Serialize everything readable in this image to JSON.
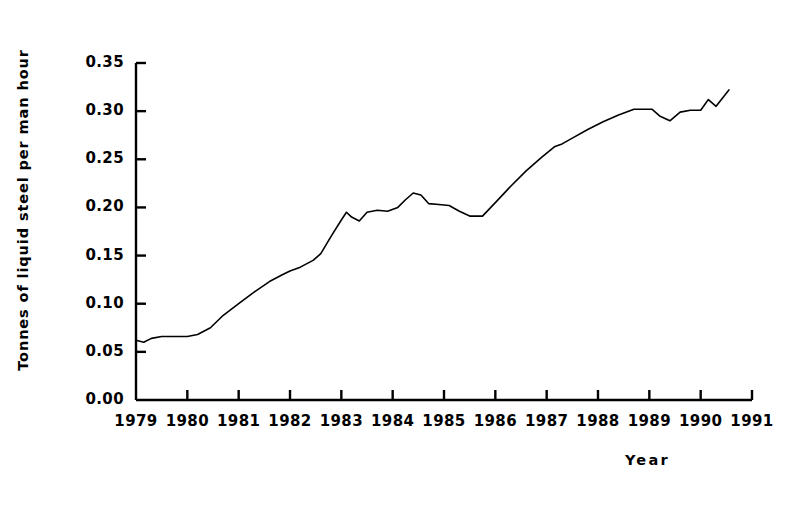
{
  "chart_data": {
    "type": "line",
    "title": "",
    "subtitle": "",
    "xlabel": "Year",
    "ylabel": "Tonnes of liquid steel per man hour",
    "xlim": [
      1979,
      1991
    ],
    "ylim": [
      0.0,
      0.35
    ],
    "grid": false,
    "legend": null,
    "x_tick_labels": [
      "1979",
      "1980",
      "1981",
      "1982",
      "1983",
      "1984",
      "1985",
      "1986",
      "1987",
      "1988",
      "1989",
      "1990",
      "1991"
    ],
    "x_ticks": [
      1979,
      1980,
      1981,
      1982,
      1983,
      1984,
      1985,
      1986,
      1987,
      1988,
      1989,
      1990,
      1991
    ],
    "y_tick_labels": [
      "0.00",
      "0.05",
      "0.10",
      "0.15",
      "0.20",
      "0.25",
      "0.30",
      "0.35"
    ],
    "y_ticks": [
      0.0,
      0.05,
      0.1,
      0.15,
      0.2,
      0.25,
      0.3,
      0.35
    ],
    "line_color": "#000000",
    "line_width": 1.6,
    "series": [
      {
        "name": "Tonnes of liquid steel per man hour",
        "x": [
          1979.0,
          1979.15,
          1979.3,
          1979.5,
          1979.75,
          1980.0,
          1980.2,
          1980.45,
          1980.7,
          1981.0,
          1981.3,
          1981.6,
          1981.85,
          1982.0,
          1982.2,
          1982.45,
          1982.6,
          1982.8,
          1983.0,
          1983.1,
          1983.2,
          1983.35,
          1983.5,
          1983.7,
          1983.9,
          1984.1,
          1984.25,
          1984.4,
          1984.55,
          1984.7,
          1984.9,
          1985.1,
          1985.3,
          1985.5,
          1985.75,
          1986.0,
          1986.3,
          1986.6,
          1986.9,
          1987.15,
          1987.3,
          1987.5,
          1987.8,
          1988.1,
          1988.4,
          1988.7,
          1988.85,
          1989.05,
          1989.2,
          1989.4,
          1989.6,
          1989.8,
          1990.0,
          1990.15,
          1990.3,
          1990.55
        ],
        "y": [
          0.062,
          0.06,
          0.064,
          0.066,
          0.066,
          0.066,
          0.068,
          0.075,
          0.088,
          0.1,
          0.112,
          0.123,
          0.13,
          0.134,
          0.138,
          0.145,
          0.152,
          0.17,
          0.187,
          0.195,
          0.19,
          0.186,
          0.195,
          0.197,
          0.196,
          0.2,
          0.208,
          0.215,
          0.213,
          0.204,
          0.203,
          0.202,
          0.196,
          0.191,
          0.191,
          0.205,
          0.222,
          0.238,
          0.252,
          0.263,
          0.266,
          0.272,
          0.281,
          0.289,
          0.296,
          0.302,
          0.302,
          0.302,
          0.295,
          0.29,
          0.299,
          0.301,
          0.301,
          0.312,
          0.305,
          0.322
        ]
      }
    ]
  },
  "axis_title_x": "Year",
  "axis_title_y": "Tonnes of liquid steel per man hour"
}
